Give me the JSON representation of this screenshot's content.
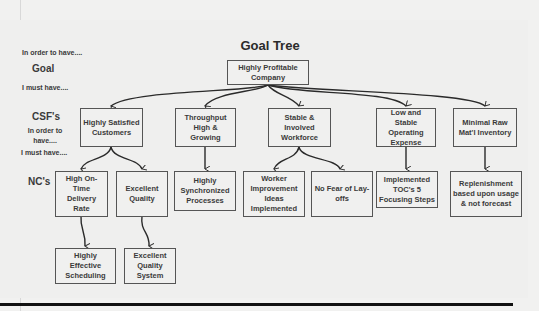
{
  "diagram": {
    "title": "Goal Tree",
    "row_labels": {
      "in_order_to_have_top": "In order to have....",
      "goal": "Goal",
      "i_must_have_top": "I must have....",
      "csf": "CSF's",
      "in_order_to_have_mid": "In order to have....",
      "i_must_have_mid": "I must have....",
      "nc": "NC's"
    },
    "goal_node": {
      "label": "Highly Profitable Company"
    },
    "csf_nodes": [
      {
        "label": "Highly Satisfied Customers"
      },
      {
        "label": "Throughput High & Growing"
      },
      {
        "label": "Stable & Involved Workforce"
      },
      {
        "label": "Low and Stable Operating Expense"
      },
      {
        "label": "Minimal Raw Mat'l Inventory"
      }
    ],
    "nc_nodes_level1": [
      {
        "label": "High On-Time Delivery Rate",
        "parent": "Highly Satisfied Customers"
      },
      {
        "label": "Excellent Quality",
        "parent": "Highly Satisfied Customers"
      },
      {
        "label": "Highly Synchronized Processes",
        "parent": "Throughput High & Growing"
      },
      {
        "label": "Worker Improvement Ideas Implemented",
        "parent": "Stable & Involved Workforce"
      },
      {
        "label": "No Fear of Lay-offs",
        "parent": "Stable & Involved Workforce"
      },
      {
        "label": "Implemented TOC's 5 Focusing Steps",
        "parent": "Low and Stable Operating Expense"
      },
      {
        "label": "Replenishment based upon usage & not forecast",
        "parent": "Minimal Raw Mat'l Inventory"
      }
    ],
    "nc_nodes_level2": [
      {
        "label": "Highly Effective Scheduling",
        "parent": "High On-Time Delivery Rate"
      },
      {
        "label": "Excellent Quality System",
        "parent": "Excellent Quality"
      }
    ],
    "colors": {
      "box_border": "#555555",
      "background": "#f0f0ef",
      "text": "#3a3a3a",
      "rule": "#111111"
    }
  }
}
